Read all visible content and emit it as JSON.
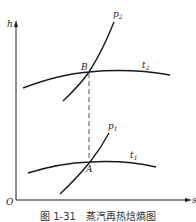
{
  "axes": {
    "y_label": "h",
    "x_label": "s",
    "origin_label": "O"
  },
  "curves": {
    "p2": {
      "label": "p",
      "subscript": "2"
    },
    "t2": {
      "label": "t",
      "subscript": "2"
    },
    "p1": {
      "label": "p",
      "subscript": "1"
    },
    "t1": {
      "label": "t",
      "subscript": "1"
    }
  },
  "points": {
    "B": "B",
    "A": "A"
  },
  "caption": "图 1-31　蒸汽再热焓熵图",
  "colors": {
    "line": "#1a1a1a",
    "dashed": "#555555",
    "background": "#ffffff"
  }
}
